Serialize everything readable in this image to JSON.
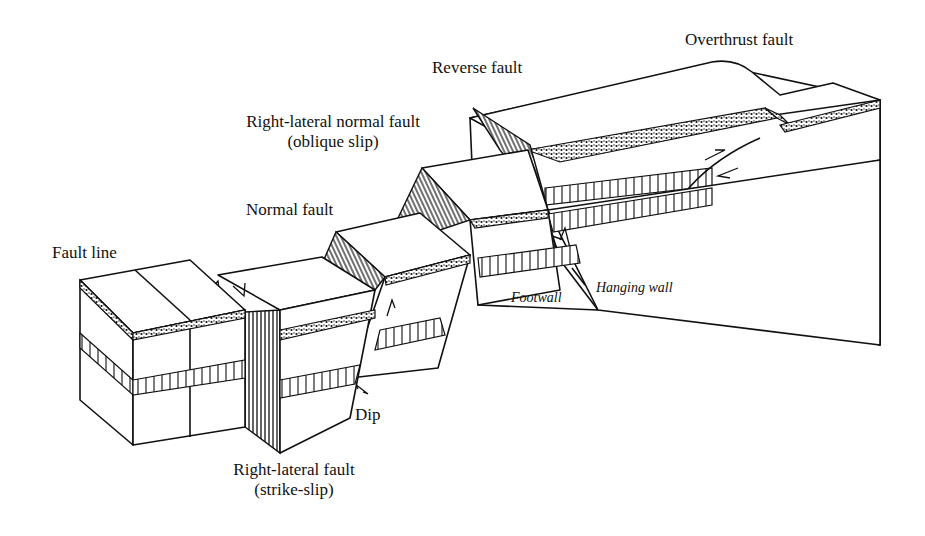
{
  "diagram": {
    "labels": {
      "fault_line": "Fault line",
      "normal_fault": "Normal fault",
      "oblique_line1": "Right-lateral normal fault",
      "oblique_line2": "(oblique slip)",
      "reverse_fault": "Reverse fault",
      "overthrust_fault": "Overthrust fault",
      "footwall": "Footwall",
      "hanging_wall": "Hanging wall",
      "dip": "Dip",
      "strike_slip_line1": "Right-lateral fault",
      "strike_slip_line2": "(strike-slip)"
    },
    "blocks": [
      {
        "id": "fault-line-block",
        "fault_type": "Fault line"
      },
      {
        "id": "strike-slip-block",
        "fault_type": "Right-lateral fault (strike-slip)"
      },
      {
        "id": "normal-fault-block",
        "fault_type": "Normal fault"
      },
      {
        "id": "oblique-slip-block",
        "fault_type": "Right-lateral normal fault (oblique slip)"
      },
      {
        "id": "reverse-fault-block",
        "fault_type": "Reverse fault"
      },
      {
        "id": "overthrust-fault-block",
        "fault_type": "Overthrust fault"
      }
    ],
    "colors": {
      "ink": "#111111",
      "paper": "#ffffff"
    }
  }
}
